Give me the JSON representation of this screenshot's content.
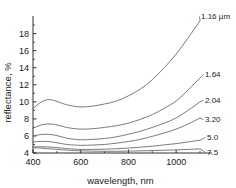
{
  "chart_data": {
    "type": "line",
    "title": "",
    "xlabel": "wavelength, nm",
    "ylabel": "reflectance, %",
    "xlim": [
      400,
      1100
    ],
    "ylim": [
      4,
      19.6
    ],
    "xticks": [
      400,
      600,
      800,
      1000
    ],
    "yticks": [
      4,
      6,
      8,
      10,
      12,
      14,
      16,
      18
    ],
    "grid": false,
    "legend_position": "right-inline-labels",
    "units_note": "1.16 µm",
    "x": [
      400,
      430,
      460,
      490,
      520,
      550,
      600,
      650,
      700,
      750,
      800,
      850,
      900,
      950,
      1000,
      1050,
      1100
    ],
    "series": [
      {
        "name": "1.16 µm",
        "label": "1.16 µm",
        "values": [
          9.2,
          9.9,
          10.25,
          10.15,
          9.85,
          9.6,
          9.4,
          9.5,
          9.75,
          10.1,
          10.7,
          11.5,
          12.6,
          14.0,
          15.6,
          17.5,
          19.5
        ]
      },
      {
        "name": "1.64",
        "label": "1.64",
        "values": [
          6.9,
          7.25,
          7.4,
          7.35,
          7.15,
          6.95,
          6.8,
          6.85,
          7.0,
          7.2,
          7.5,
          7.95,
          8.5,
          9.25,
          10.1,
          11.4,
          12.8
        ]
      },
      {
        "name": "2.04",
        "label": "2.04",
        "values": [
          6.0,
          6.15,
          6.2,
          6.1,
          5.9,
          5.7,
          5.55,
          5.6,
          5.7,
          5.9,
          6.2,
          6.55,
          7.0,
          7.5,
          8.1,
          9.0,
          10.0
        ]
      },
      {
        "name": "3.20",
        "label": "3.20",
        "values": [
          5.3,
          5.35,
          5.35,
          5.25,
          5.1,
          4.98,
          4.9,
          4.93,
          5.0,
          5.15,
          5.35,
          5.6,
          5.95,
          6.35,
          6.8,
          7.4,
          8.1
        ]
      },
      {
        "name": "5.0",
        "label": "5.0",
        "values": [
          4.72,
          4.73,
          4.72,
          4.66,
          4.58,
          4.5,
          4.42,
          4.42,
          4.45,
          4.5,
          4.58,
          4.68,
          4.8,
          4.95,
          5.1,
          5.3,
          5.5
        ]
      },
      {
        "name": "7.5",
        "label": "7.5",
        "values": [
          4.62,
          4.58,
          4.52,
          4.45,
          4.38,
          4.32,
          4.25,
          4.22,
          4.2,
          4.2,
          4.22,
          4.25,
          4.28,
          4.32,
          4.36,
          4.42,
          4.48
        ]
      }
    ],
    "colors": {
      "axis": "#1a1a1a",
      "curve": "#6b6b6b",
      "text": "#1a1a1a",
      "background": "#ffffff"
    }
  },
  "axes": {
    "xlabel": "wavelength, nm",
    "ylabel": "reflectance, %",
    "xtick_labels": [
      "400",
      "600",
      "800",
      "1000"
    ],
    "ytick_labels": [
      "4",
      "6",
      "8",
      "10",
      "12",
      "14",
      "16",
      "18"
    ]
  },
  "curve_labels": [
    "1.16 µm",
    "1.64",
    "2.04",
    "3.20",
    "5.0",
    "7.5"
  ]
}
